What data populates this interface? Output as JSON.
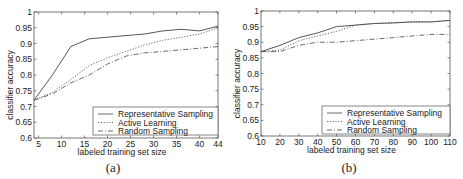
{
  "chart_data": [
    {
      "id": "a",
      "type": "line",
      "caption": "(a)",
      "xlabel": "labeled training set size",
      "ylabel": "classifier accuracy",
      "xlim": [
        4,
        44
      ],
      "ylim": [
        0.6,
        1.0
      ],
      "xticks": [
        5,
        10,
        15,
        20,
        25,
        30,
        35,
        40,
        44
      ],
      "yticks": [
        0.6,
        0.65,
        0.7,
        0.75,
        0.8,
        0.85,
        0.9,
        0.95,
        1
      ],
      "ytick_labels": [
        "0.6",
        "0.65",
        "0.7",
        "0.75",
        "0.8",
        "0.85",
        "0.9",
        "0.95",
        "1"
      ],
      "grid": false,
      "legend_position": "lower right",
      "series": [
        {
          "name": "Representative Sampling",
          "style": "solid",
          "x": [
            4,
            8,
            12,
            16,
            20,
            24,
            28,
            32,
            36,
            40,
            44
          ],
          "y": [
            0.72,
            0.8,
            0.89,
            0.915,
            0.92,
            0.925,
            0.93,
            0.94,
            0.945,
            0.94,
            0.955
          ]
        },
        {
          "name": "Active Learning",
          "style": "dotted",
          "x": [
            4,
            8,
            12,
            16,
            20,
            24,
            28,
            32,
            36,
            40,
            44
          ],
          "y": [
            0.72,
            0.745,
            0.785,
            0.83,
            0.855,
            0.875,
            0.895,
            0.91,
            0.92,
            0.93,
            0.95
          ]
        },
        {
          "name": "Random Sampling",
          "style": "dashdot",
          "x": [
            4,
            8,
            12,
            16,
            20,
            24,
            28,
            32,
            36,
            40,
            44
          ],
          "y": [
            0.72,
            0.74,
            0.775,
            0.8,
            0.835,
            0.86,
            0.87,
            0.875,
            0.88,
            0.885,
            0.89
          ]
        }
      ]
    },
    {
      "id": "b",
      "type": "line",
      "caption": "(b)",
      "xlabel": "labeled training set size",
      "ylabel": "classifier accuracy",
      "xlim": [
        10,
        110
      ],
      "ylim": [
        0.6,
        1.0
      ],
      "xticks": [
        10,
        20,
        30,
        40,
        50,
        60,
        70,
        80,
        90,
        100,
        110
      ],
      "yticks": [
        0.6,
        0.65,
        0.7,
        0.75,
        0.8,
        0.85,
        0.9,
        0.95,
        1
      ],
      "ytick_labels": [
        "0.6",
        "0.65",
        "0.7",
        "0.75",
        "0.8",
        "0.85",
        "0.9",
        "0.95",
        "1"
      ],
      "grid": false,
      "legend_position": "lower right",
      "series": [
        {
          "name": "Representative Sampling",
          "style": "solid",
          "x": [
            10,
            20,
            30,
            40,
            50,
            60,
            70,
            80,
            90,
            100,
            110
          ],
          "y": [
            0.87,
            0.89,
            0.915,
            0.93,
            0.95,
            0.955,
            0.96,
            0.962,
            0.965,
            0.965,
            0.97
          ]
        },
        {
          "name": "Active Learning",
          "style": "dotted",
          "x": [
            10,
            20,
            30,
            40,
            50,
            60,
            70,
            80,
            90,
            100,
            110
          ],
          "y": [
            0.87,
            0.875,
            0.905,
            0.92,
            0.935,
            0.955,
            0.96,
            0.962,
            0.965,
            0.965,
            0.97
          ]
        },
        {
          "name": "Random Sampling",
          "style": "dashdot",
          "x": [
            10,
            20,
            30,
            40,
            50,
            60,
            70,
            80,
            90,
            100,
            110
          ],
          "y": [
            0.87,
            0.87,
            0.89,
            0.9,
            0.9,
            0.905,
            0.91,
            0.915,
            0.92,
            0.925,
            0.925
          ]
        }
      ]
    }
  ]
}
